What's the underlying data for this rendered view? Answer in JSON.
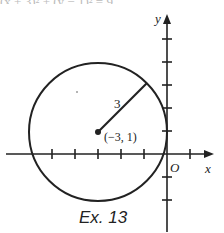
{
  "header": {
    "partial_text": "(x + 3)² + (y − 1)² = 9"
  },
  "diagram": {
    "axes": {
      "x_label": "x",
      "y_label": "y",
      "origin_label": "O"
    },
    "circle": {
      "center": [
        -3,
        1
      ],
      "radius": 3
    },
    "center_label": "(−3, 1)",
    "radius_label": "3",
    "caption": "Ex. 13"
  }
}
